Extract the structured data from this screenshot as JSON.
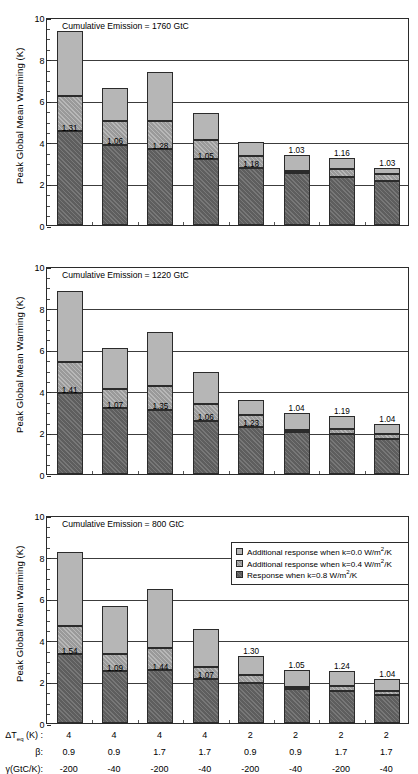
{
  "figure": {
    "y_axis_label": "Peak Global Mean Warming (K)",
    "y_ticks": [
      "0",
      "2",
      "4",
      "6",
      "8",
      "10"
    ]
  },
  "legend": {
    "items": [
      {
        "name": "legend-k00",
        "text_pre": "Additional response when k=0.0 W/m",
        "sup": "2",
        "text_post": "/K",
        "color": "#b6b6b6"
      },
      {
        "name": "legend-k04",
        "text_pre": "Additional response when k=0.4 W/m",
        "sup": "2",
        "text_post": "/K",
        "color": "#9a9a9a"
      },
      {
        "name": "legend-k08",
        "text_pre": "Response when k=0.8 W/m",
        "sup": "2",
        "text_post": "/K",
        "color": "#5e5e5e"
      }
    ]
  },
  "x_axis_rows": [
    {
      "name": "row-dteq",
      "label_pre": "ΔT",
      "label_sub": "eq",
      "label_post": " (K) :",
      "values": [
        "4",
        "4",
        "4",
        "4",
        "2",
        "2",
        "2",
        "2"
      ]
    },
    {
      "name": "row-beta",
      "label_pre": "β:",
      "label_sub": "",
      "label_post": "",
      "values": [
        "0.9",
        "0.9",
        "1.7",
        "1.7",
        "0.9",
        "0.9",
        "1.7",
        "1.7"
      ]
    },
    {
      "name": "row-gamma",
      "label_pre": "γ(GtC/K):",
      "label_sub": "",
      "label_post": "",
      "values": [
        "-200",
        "-40",
        "-200",
        "-40",
        "-200",
        "-40",
        "-200",
        "-40"
      ]
    }
  ],
  "chart_data": [
    {
      "type": "bar",
      "name": "panel-1760",
      "title": "Cumulative Emission = 1760 GtC",
      "ylabel": "Peak Global Mean Warming (K)",
      "xlabel": "",
      "ylim": [
        0,
        10
      ],
      "yticks": [
        0,
        2,
        4,
        6,
        8,
        10
      ],
      "grid": true,
      "stacked": true,
      "categories": [
        "1",
        "2",
        "3",
        "4",
        "5",
        "6",
        "7",
        "8"
      ],
      "series": [
        {
          "name": "Response when k=0.8 W/m2/K",
          "values": [
            4.5,
            3.85,
            3.65,
            3.15,
            2.75,
            2.5,
            2.3,
            2.1
          ]
        },
        {
          "name": "Additional response when k=0.4 W/m2/K",
          "values": [
            1.7,
            1.15,
            1.35,
            0.95,
            0.55,
            0.1,
            0.4,
            0.35
          ]
        },
        {
          "name": "Additional response when k=0.0 W/m2/K",
          "values": [
            3.15,
            1.6,
            2.35,
            1.3,
            0.7,
            0.75,
            0.5,
            0.3
          ]
        }
      ],
      "totals": [
        9.35,
        6.6,
        7.35,
        5.4,
        4.0,
        3.35,
        3.2,
        2.75
      ],
      "annotations": [
        "1.31",
        "1.06",
        "1.28",
        "1.05",
        "1.18",
        "1.03",
        "1.16",
        "1.03"
      ]
    },
    {
      "type": "bar",
      "name": "panel-1220",
      "title": "Cumulative Emission = 1220 GtC",
      "ylabel": "Peak Global Mean Warming (K)",
      "xlabel": "",
      "ylim": [
        0,
        10
      ],
      "yticks": [
        0,
        2,
        4,
        6,
        8,
        10
      ],
      "grid": true,
      "stacked": true,
      "categories": [
        "1",
        "2",
        "3",
        "4",
        "5",
        "6",
        "7",
        "8"
      ],
      "series": [
        {
          "name": "Response when k=0.8 W/m2/K",
          "values": [
            3.88,
            3.15,
            3.08,
            2.57,
            2.28,
            2.0,
            1.9,
            1.67
          ]
        },
        {
          "name": "Additional response when k=0.4 W/m2/K",
          "values": [
            1.52,
            0.95,
            1.15,
            0.8,
            0.55,
            0.12,
            0.28,
            0.23
          ]
        },
        {
          "name": "Additional response when k=0.0 W/m2/K",
          "values": [
            3.38,
            1.98,
            2.6,
            1.53,
            0.72,
            0.8,
            0.62,
            0.5
          ]
        }
      ],
      "totals": [
        8.78,
        6.08,
        6.83,
        4.9,
        3.55,
        2.92,
        2.8,
        2.4
      ],
      "annotations": [
        "1.41",
        "1.07",
        "1.35",
        "1.06",
        "1.23",
        "1.04",
        "1.19",
        "1.04"
      ]
    },
    {
      "type": "bar",
      "name": "panel-800",
      "title": "Cumulative Emission = 800 GtC",
      "ylabel": "Peak Global Mean Warming (K)",
      "xlabel": "",
      "ylim": [
        0,
        10
      ],
      "yticks": [
        0,
        2,
        4,
        6,
        8,
        10
      ],
      "grid": true,
      "stacked": true,
      "categories": [
        "1",
        "2",
        "3",
        "4",
        "5",
        "6",
        "7",
        "8"
      ],
      "series": [
        {
          "name": "Response when k=0.8 W/m2/K",
          "values": [
            3.3,
            2.48,
            2.53,
            2.12,
            1.9,
            1.65,
            1.55,
            1.35
          ]
        },
        {
          "name": "Additional response when k=0.4 W/m2/K",
          "values": [
            1.38,
            0.83,
            1.08,
            0.57,
            0.42,
            0.1,
            0.25,
            0.2
          ]
        },
        {
          "name": "Additional response when k=0.0 W/m2/K",
          "values": [
            3.55,
            2.3,
            2.83,
            1.83,
            0.88,
            0.82,
            0.72,
            0.55
          ]
        }
      ],
      "totals": [
        8.23,
        5.61,
        6.44,
        4.52,
        3.2,
        2.57,
        2.52,
        2.1
      ],
      "annotations": [
        "1.54",
        "1.09",
        "1.44",
        "1.07",
        "1.30",
        "1.05",
        "1.24",
        "1.04"
      ]
    }
  ]
}
